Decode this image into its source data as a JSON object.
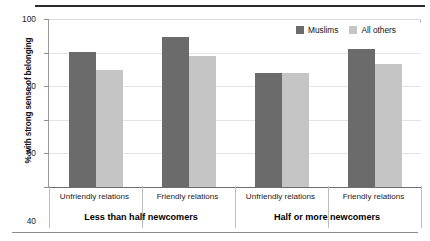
{
  "chart_data": {
    "type": "bar",
    "title": "",
    "subtitle": "",
    "xlabel": "",
    "ylabel": "% with strong sense of belonging",
    "ylim": [
      0,
      100
    ],
    "yticks": [
      0,
      20,
      40,
      60,
      80,
      100
    ],
    "ytick_labels": [
      "0",
      "20",
      "40",
      "60",
      "80",
      "100"
    ],
    "grid": "horizontal",
    "legend_position": "top-right",
    "categories": [
      "Unfriendly relations",
      "Friendly relations",
      "Unfriendly relations",
      "Friendly relations"
    ],
    "group_labels": [
      "Less than half newcomers",
      "Half or more newcomers"
    ],
    "groups": [
      {
        "label": "Less than half newcomers",
        "cells": [
          {
            "label": "Unfriendly relations",
            "values": [
              80.5,
              69.5
            ]
          },
          {
            "label": "Friendly relations",
            "values": [
              89.0,
              78.0
            ]
          }
        ]
      },
      {
        "label": "Half or more newcomers",
        "cells": [
          {
            "label": "Unfriendly relations",
            "values": [
              68.0,
              68.0
            ]
          },
          {
            "label": "Friendly relations",
            "values": [
              82.0,
              73.5
            ]
          }
        ]
      }
    ],
    "series": [
      {
        "name": "Muslims",
        "color": "#6b6b6b",
        "values": [
          80.5,
          89.0,
          68.0,
          82.0
        ]
      },
      {
        "name": "All others",
        "color": "#c5c5c5",
        "values": [
          69.5,
          78.0,
          68.0,
          73.5
        ]
      }
    ]
  },
  "legend": {
    "items": [
      {
        "label": "Muslims",
        "color": "#6b6b6b"
      },
      {
        "label": "All others",
        "color": "#c5c5c5"
      }
    ]
  },
  "axis": {
    "y_title": "% with strong sense of belonging",
    "y_tick_labels": [
      "100",
      "80",
      "60",
      "40",
      "20",
      "0"
    ]
  },
  "x_cells": [
    "Unfriendly relations",
    "Friendly relations",
    "Unfriendly relations",
    "Friendly relations"
  ],
  "group_labels": [
    "Less than half newcomers",
    "Half or more newcomers"
  ]
}
